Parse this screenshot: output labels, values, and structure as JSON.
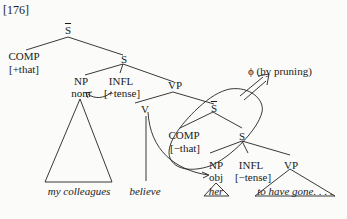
{
  "example_number": "[176]",
  "nodes": {
    "sbar_top": "S",
    "comp_top": "COMP",
    "comp_top_feature": "[+that]",
    "s_top": "S",
    "np_subj": "NP",
    "np_subj_case": "nom",
    "infl_top": "INFL",
    "infl_top_feature": "[+tense]",
    "vp_top": "VP",
    "v": "V",
    "sbar_low": "S",
    "comp_low": "COMP",
    "comp_low_feature": "[−that]",
    "s_low": "S",
    "np_obj": "NP",
    "np_obj_case": "obj",
    "infl_low": "INFL",
    "infl_low_feature": "[−tense]",
    "vp_low": "VP"
  },
  "leaves": {
    "subject": "my colleagues",
    "verb": "believe",
    "object": "her",
    "complement": "to have gone. . . ."
  },
  "annotation": {
    "pruning": "ϕ (by pruning)"
  }
}
